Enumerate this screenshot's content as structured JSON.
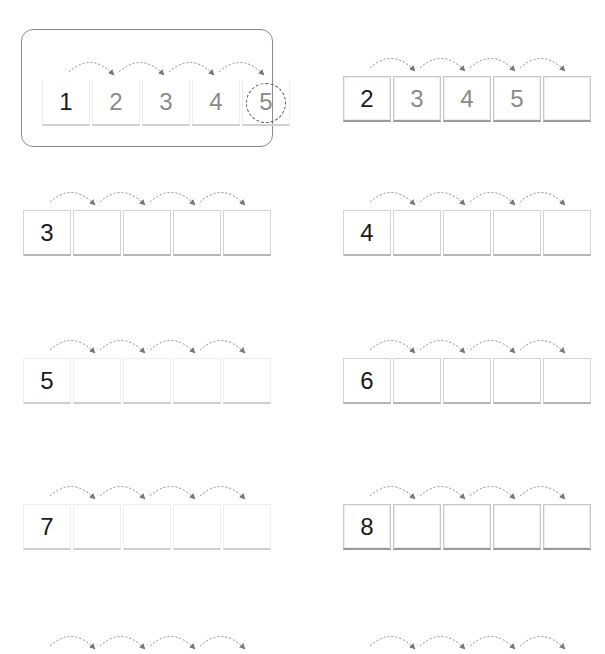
{
  "example": {
    "cells": [
      "1",
      "2",
      "3",
      "4",
      "5"
    ],
    "circled_index": 4
  },
  "rows": [
    {
      "start": "2",
      "cells": [
        "2",
        "3",
        "4",
        "5",
        ""
      ]
    },
    {
      "start": "3",
      "cells": [
        "3",
        "",
        "",
        "",
        ""
      ]
    },
    {
      "start": "4",
      "cells": [
        "4",
        "",
        "",
        "",
        ""
      ]
    },
    {
      "start": "5",
      "cells": [
        "5",
        "",
        "",
        "",
        ""
      ]
    },
    {
      "start": "6",
      "cells": [
        "6",
        "",
        "",
        "",
        ""
      ]
    },
    {
      "start": "7",
      "cells": [
        "7",
        "",
        "",
        "",
        ""
      ]
    },
    {
      "start": "8",
      "cells": [
        "8",
        "",
        "",
        "",
        ""
      ]
    }
  ],
  "colors": {
    "given_digit": "#1a1a1a",
    "filled_digit": "#8a8a8a",
    "arrow": "#777777",
    "cell_border": "#d4d4d4"
  }
}
